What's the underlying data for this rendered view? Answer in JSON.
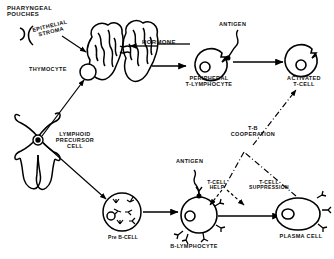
{
  "figure": {
    "type": "biological-flow-diagram",
    "background_color": "#ffffff",
    "ink_color": "#000000"
  },
  "labels": {
    "pharyngeal_pouches": "PHARYNGEAL\nPOUCHES",
    "epithelial_stroma": "EPITHELIAL\nSTROMA",
    "thymocyte": "THYMOCYTE",
    "hormone": "HORMONE",
    "antigen_top": "ANTIGEN",
    "peripheral_t_lymphocyte": "PERIPHERAL\nT-LYMPHOCYTE",
    "activated_t_cell": "ACTIVATED\nT-CELL",
    "lymphoid_precursor_cell": "LYMPHOID\nPRECURSOR\nCELL",
    "pre_b_cell": "Pre B-CELL",
    "antigen_bottom": "ANTIGEN",
    "b_lymphocyte": "B-LYMPHOCYTE",
    "t_b_cooperation": "T-B\nCOOPERATION",
    "t_cell_help": "T-CELL\nHELP",
    "t_cell_suppression": "T-CELL\nSUPPRESSION",
    "plasma_cell": "PLASMA CELL"
  },
  "nodes": [
    {
      "id": "pharyngeal-pouches",
      "label": "PHARYNGEAL POUCHES",
      "shape": "paired-arcs"
    },
    {
      "id": "thymus",
      "label": "EPITHELIAL STROMA",
      "shape": "bilobed-thymus"
    },
    {
      "id": "thymocyte",
      "label": "THYMOCYTE",
      "shape": "small-circle-in-thymus"
    },
    {
      "id": "bone-marrow",
      "label": "LYMPHOID PRECURSOR CELL",
      "shape": "marrow-lobes"
    },
    {
      "id": "peripheral-t-lymphocyte",
      "label": "PERIPHERAL T-LYMPHOCYTE",
      "shape": "circle-with-notch-and-nucleus"
    },
    {
      "id": "activated-t-cell",
      "label": "ACTIVATED T-CELL",
      "shape": "circle-with-notch-and-nucleus"
    },
    {
      "id": "pre-b-cell",
      "label": "Pre B-CELL",
      "shape": "circle-with-internal-y-receptors"
    },
    {
      "id": "b-lymphocyte",
      "label": "B-LYMPHOCYTE",
      "shape": "circle-with-surface-y-receptors"
    },
    {
      "id": "plasma-cell",
      "label": "PLASMA CELL",
      "shape": "ellipse-with-secreted-y-antibodies"
    }
  ],
  "edges": [
    {
      "from": "thymus",
      "to": "hormone",
      "style": "solid-arrow",
      "label": "HORMONE"
    },
    {
      "from": "hormone",
      "to": "peripheral-t-lymphocyte",
      "style": "solid-arrow",
      "label": ""
    },
    {
      "from": "peripheral-t-lymphocyte",
      "to": "activated-t-cell",
      "style": "solid-arrow",
      "label": ""
    },
    {
      "from": "antigen-top",
      "to": "peripheral-t-lymphocyte",
      "style": "squiggle",
      "label": "ANTIGEN"
    },
    {
      "from": "bone-marrow",
      "to": "thymocyte",
      "style": "solid-arrow",
      "label": ""
    },
    {
      "from": "bone-marrow",
      "to": "pre-b-cell",
      "style": "solid-arrow",
      "label": ""
    },
    {
      "from": "pre-b-cell",
      "to": "b-lymphocyte",
      "style": "solid-arrow",
      "label": ""
    },
    {
      "from": "antigen-bottom",
      "to": "b-lymphocyte",
      "style": "squiggle",
      "label": "ANTIGEN"
    },
    {
      "from": "b-lymphocyte",
      "to": "plasma-cell",
      "style": "solid-arrow",
      "label": ""
    },
    {
      "from": "plasma-cell",
      "to": "activated-t-cell",
      "style": "dash-dot-arrow",
      "label": "T-B COOPERATION"
    },
    {
      "from": "t-b-cooperation",
      "to": "b-lymphocyte",
      "style": "dashed-arrow",
      "label": "T-CELL HELP"
    },
    {
      "from": "t-b-cooperation",
      "to": "plasma-cell",
      "style": "dashed-arrow",
      "label": "T-CELL SUPPRESSION"
    }
  ]
}
